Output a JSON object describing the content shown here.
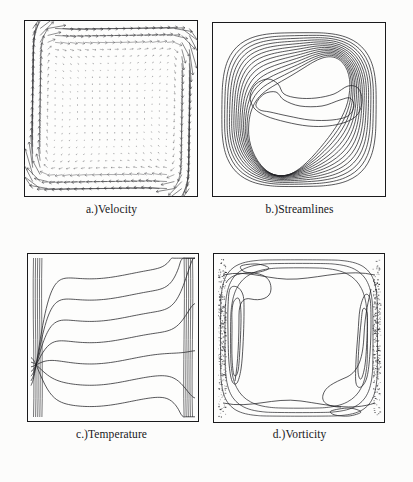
{
  "figure": {
    "background_color": "#fcfcfb",
    "ink_color": "#1a1a1c",
    "width": 413,
    "height": 482,
    "panel_count": 4
  },
  "panels": [
    {
      "id": "velocity",
      "caption": "a.)Velocity",
      "type": "vector-field",
      "position": {
        "x": 24,
        "y": 20,
        "w": 174,
        "h": 177
      },
      "description": "Velocity vector field in square cavity, dense long vertical arrows along left and right walls, small arrows in core"
    },
    {
      "id": "streamlines",
      "caption": "b.)Streamlines",
      "type": "contour",
      "position": {
        "x": 212,
        "y": 22,
        "w": 174,
        "h": 175
      },
      "description": "Nested closed streamline contours of a single recirculating cell with S-shaped inner contours"
    },
    {
      "id": "temperature",
      "caption": "c.)Temperature",
      "type": "contour",
      "position": {
        "x": 27,
        "y": 253,
        "w": 172,
        "h": 169
      },
      "description": "Horizontal isotherms stacked vertically, compressed into thermal boundary layers at left and right walls"
    },
    {
      "id": "vorticity",
      "caption": "d.)Vorticity",
      "type": "contour",
      "position": {
        "x": 213,
        "y": 253,
        "w": 172,
        "h": 170
      },
      "description": "Vorticity contours concentrated in thin boundary layers along the vertical walls, near-uniform core"
    }
  ],
  "chart_data": [
    {
      "type": "scatter",
      "title": "a.)Velocity",
      "xlabel": "",
      "ylabel": "",
      "xlim": [
        0,
        1
      ],
      "ylim": [
        0,
        1
      ],
      "grid": false,
      "legend": "none",
      "field": "velocity-vectors",
      "grid_nx": 22,
      "grid_ny": 24,
      "notes": "Buoyancy-driven cavity flow: upward jet along left (hot) wall, downward jet along right (cold) wall, quiescent core"
    },
    {
      "type": "line",
      "title": "b.)Streamlines",
      "xlabel": "",
      "ylabel": "",
      "xlim": [
        0,
        1
      ],
      "ylim": [
        0,
        1
      ],
      "grid": false,
      "legend": "none",
      "contour_count": 14,
      "levels": [
        0.05,
        0.12,
        0.2,
        0.28,
        0.36,
        0.44,
        0.52,
        0.6,
        0.68,
        0.76,
        0.84,
        0.9,
        0.95,
        0.99
      ],
      "notes": "Closed nested streamfunction contours of one primary vortex"
    },
    {
      "type": "line",
      "title": "c.)Temperature",
      "xlabel": "",
      "ylabel": "",
      "xlim": [
        0,
        1
      ],
      "ylim": [
        0,
        1
      ],
      "grid": false,
      "legend": "none",
      "contour_count": 7,
      "levels": [
        0.1,
        0.2,
        0.35,
        0.5,
        0.65,
        0.8,
        0.9
      ],
      "notes": "Isotherms nearly horizontal in the stratified core, vertical inside wall boundary layers"
    },
    {
      "type": "line",
      "title": "d.)Vorticity",
      "xlabel": "",
      "ylabel": "",
      "xlim": [
        0,
        1
      ],
      "ylim": [
        0,
        1
      ],
      "grid": false,
      "legend": "none",
      "contour_count": 8,
      "levels": [
        -40,
        -20,
        -8,
        -2,
        2,
        8,
        20,
        40
      ],
      "notes": "Vorticity extrema confined to thin wall layers; core nearly vorticity free"
    }
  ]
}
